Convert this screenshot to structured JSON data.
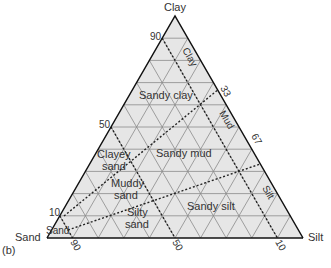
{
  "figure_label": "(b)",
  "corners": {
    "top": "Clay",
    "left": "Sand",
    "right": "Silt"
  },
  "axis_ticks": {
    "left_edge": [
      "90",
      "50",
      "10"
    ],
    "right_edge": [
      "33",
      "67"
    ],
    "base": [
      "90",
      "50",
      "10"
    ]
  },
  "regions": [
    {
      "name": "Clay"
    },
    {
      "name": "Sandy clay"
    },
    {
      "name": "Mud"
    },
    {
      "name": "Clayey sand"
    },
    {
      "name": "Sandy mud"
    },
    {
      "name": "Muddy sand"
    },
    {
      "name": "Sandy silt"
    },
    {
      "name": "Silty sand"
    },
    {
      "name": "Silt"
    },
    {
      "name": "Sand"
    }
  ],
  "labels": {
    "clay_region": "Clay",
    "sandy_clay": "Sandy clay",
    "mud": "Mud",
    "clayey_sand_1": "Clayey",
    "clayey_sand_2": "sand",
    "sandy_mud": "Sandy mud",
    "muddy_sand_1": "Muddy",
    "muddy_sand_2": "sand",
    "sandy_silt": "Sandy silt",
    "silty_sand_1": "Silty",
    "silty_sand_2": "sand",
    "silt_region": "Silt",
    "sand_region": "Sand"
  },
  "colors": {
    "fill": "#e6e6e6",
    "grid": "#8a8a8a",
    "outline": "#111111",
    "dashed": "#222222"
  }
}
